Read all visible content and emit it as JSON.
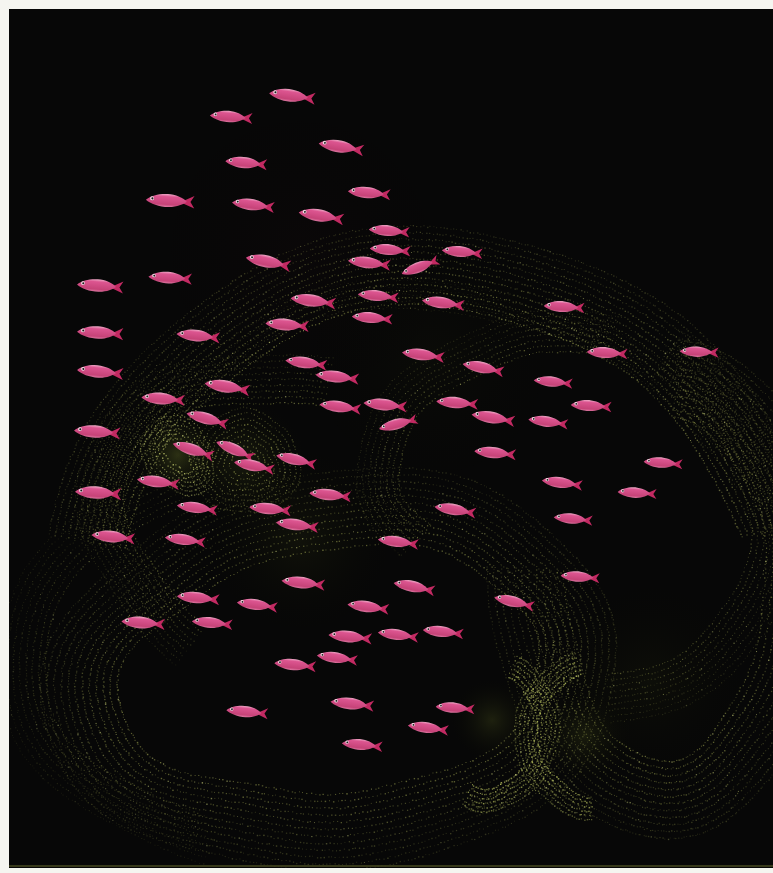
{
  "scene": {
    "description": "school of pink fish swimming left over pointillist olive-green coral scroll contours on a black field, white print border",
    "width": 773,
    "height": 873,
    "background_color": "#070707",
    "frame_color": "#f5f5f0",
    "bottom_edge_line_color": "#43461f",
    "frame_padding": {
      "top": 9,
      "left": 9,
      "right": 0,
      "bottom": 5
    },
    "seed": 7
  },
  "palette": {
    "dot_base": "#8f944a",
    "dot_bright": "#c2ca6c",
    "dot_dim": "#5d6030",
    "sparkle": "#d3da7f"
  },
  "fish_style": {
    "length": 46,
    "height": 13,
    "body_color": "#dc5590",
    "body_shade": "#c64378",
    "belly_color": "#e690b4",
    "dorsal_highlight": "#f2bcd3",
    "tail_color": "#c22a62",
    "eye_ring": "#ecdfe3",
    "pupil": "#201a1d"
  },
  "fish": [
    [
      292,
      96,
      8,
      1.0
    ],
    [
      231,
      117,
      5,
      0.92
    ],
    [
      341,
      147,
      10,
      0.98
    ],
    [
      246,
      163,
      6,
      0.9
    ],
    [
      170,
      201,
      4,
      1.05
    ],
    [
      253,
      205,
      8,
      0.92
    ],
    [
      369,
      193,
      6,
      0.92
    ],
    [
      321,
      216,
      10,
      0.98
    ],
    [
      389,
      231,
      5,
      0.88
    ],
    [
      268,
      262,
      12,
      0.98
    ],
    [
      369,
      263,
      7,
      0.92
    ],
    [
      100,
      286,
      5,
      1.0
    ],
    [
      170,
      278,
      4,
      0.94
    ],
    [
      313,
      301,
      8,
      0.98
    ],
    [
      390,
      250,
      5,
      0.88
    ],
    [
      420,
      267,
      -20,
      0.85
    ],
    [
      462,
      252,
      6,
      0.88
    ],
    [
      287,
      325,
      5,
      0.94
    ],
    [
      100,
      333,
      4,
      1.0
    ],
    [
      198,
      336,
      6,
      0.94
    ],
    [
      443,
      303,
      8,
      0.92
    ],
    [
      564,
      307,
      4,
      0.88
    ],
    [
      100,
      372,
      6,
      1.0
    ],
    [
      227,
      387,
      10,
      0.98
    ],
    [
      337,
      377,
      7,
      0.94
    ],
    [
      372,
      318,
      5,
      0.88
    ],
    [
      607,
      353,
      4,
      0.88
    ],
    [
      699,
      352,
      3,
      0.84
    ],
    [
      423,
      355,
      8,
      0.92
    ],
    [
      483,
      368,
      12,
      0.9
    ],
    [
      163,
      399,
      5,
      0.94
    ],
    [
      207,
      419,
      16,
      0.92
    ],
    [
      97,
      432,
      5,
      1.0
    ],
    [
      193,
      450,
      18,
      0.92
    ],
    [
      235,
      450,
      24,
      0.88
    ],
    [
      254,
      466,
      12,
      0.88
    ],
    [
      158,
      482,
      8,
      0.92
    ],
    [
      98,
      493,
      4,
      1.0
    ],
    [
      270,
      509,
      6,
      0.9
    ],
    [
      197,
      508,
      8,
      0.88
    ],
    [
      296,
      460,
      14,
      0.88
    ],
    [
      113,
      537,
      6,
      0.94
    ],
    [
      185,
      540,
      8,
      0.88
    ],
    [
      385,
      405,
      6,
      0.94
    ],
    [
      398,
      424,
      -14,
      0.85
    ],
    [
      457,
      403,
      5,
      0.9
    ],
    [
      493,
      418,
      10,
      0.94
    ],
    [
      591,
      406,
      4,
      0.88
    ],
    [
      548,
      422,
      8,
      0.86
    ],
    [
      495,
      453,
      6,
      0.9
    ],
    [
      553,
      382,
      6,
      0.84
    ],
    [
      663,
      463,
      5,
      0.84
    ],
    [
      562,
      483,
      8,
      0.88
    ],
    [
      637,
      493,
      4,
      0.84
    ],
    [
      455,
      510,
      10,
      0.9
    ],
    [
      573,
      519,
      6,
      0.84
    ],
    [
      297,
      525,
      8,
      0.92
    ],
    [
      330,
      495,
      6,
      0.9
    ],
    [
      143,
      623,
      5,
      0.94
    ],
    [
      198,
      598,
      6,
      0.92
    ],
    [
      257,
      605,
      8,
      0.88
    ],
    [
      212,
      623,
      6,
      0.88
    ],
    [
      303,
      583,
      7,
      0.94
    ],
    [
      368,
      607,
      8,
      0.9
    ],
    [
      414,
      587,
      12,
      0.9
    ],
    [
      350,
      637,
      6,
      0.94
    ],
    [
      398,
      635,
      8,
      0.88
    ],
    [
      443,
      632,
      7,
      0.88
    ],
    [
      514,
      602,
      14,
      0.88
    ],
    [
      580,
      577,
      5,
      0.84
    ],
    [
      398,
      542,
      8,
      0.88
    ],
    [
      295,
      665,
      6,
      0.9
    ],
    [
      337,
      658,
      8,
      0.88
    ],
    [
      247,
      712,
      6,
      0.9
    ],
    [
      352,
      704,
      7,
      0.94
    ],
    [
      428,
      728,
      8,
      0.88
    ],
    [
      362,
      745,
      6,
      0.88
    ],
    [
      455,
      708,
      5,
      0.84
    ],
    [
      306,
      363,
      8,
      0.9
    ],
    [
      378,
      296,
      6,
      0.88
    ],
    [
      340,
      407,
      8,
      0.9
    ]
  ],
  "contours": [
    {
      "name": "top-band",
      "cx": 430,
      "cy": 600,
      "rx": 318,
      "ry": 290,
      "rot": -4,
      "rings": 13,
      "gap": 6.5,
      "from": 195,
      "to": 352,
      "color": "#8f944a",
      "alpha": 0.75,
      "dot": 1.2,
      "spacing": 3.2,
      "wobble": 6,
      "phase": 0.5,
      "fade": 0.55
    },
    {
      "name": "top-outer-faint",
      "cx": 430,
      "cy": 640,
      "rx": 350,
      "ry": 330,
      "rot": -3,
      "rings": 5,
      "gap": 7,
      "from": 205,
      "to": 335,
      "color": "#5d6030",
      "alpha": 0.5,
      "dot": 1.0,
      "spacing": 3.8,
      "wobble": 7,
      "phase": 1.1,
      "fade": 0.7
    },
    {
      "name": "upper-fold",
      "cx": 520,
      "cy": 445,
      "rx": 130,
      "ry": 85,
      "rot": -28,
      "rings": 8,
      "gap": 6,
      "from": 160,
      "to": 330,
      "color": "#7d8140",
      "alpha": 0.7,
      "dot": 1.1,
      "spacing": 3.2,
      "wobble": 4,
      "phase": 2.1,
      "fade": 0.6
    },
    {
      "name": "left-arc",
      "cx": 300,
      "cy": 530,
      "rx": 178,
      "ry": 128,
      "rot": 18,
      "rings": 9,
      "gap": 6,
      "from": 110,
      "to": 265,
      "color": "#80853f",
      "alpha": 0.7,
      "dot": 1.1,
      "spacing": 3.2,
      "wobble": 5,
      "phase": 4.0,
      "fade": 0.6
    },
    {
      "name": "knot-spiral",
      "cx": 245,
      "cy": 462,
      "rx": 16,
      "ry": 13,
      "rot": 20,
      "rings": 8,
      "gap": 5.5,
      "from": 0,
      "to": 360,
      "color": "#a8ae55",
      "alpha": 0.85,
      "dot": 1.1,
      "spacing": 3.0,
      "wobble": 2,
      "phase": 1.2,
      "fade": 0.5
    },
    {
      "name": "bright-blob",
      "cx": 178,
      "cy": 455,
      "rx": 10,
      "ry": 20,
      "rot": -35,
      "rings": 6,
      "gap": 4.5,
      "from": 0,
      "to": 360,
      "color": "#c2ca6c",
      "alpha": 0.9,
      "dot": 1.2,
      "spacing": 2.6,
      "wobble": 2,
      "phase": 3.3,
      "fade": 0.45
    },
    {
      "name": "bowl",
      "cx": 332,
      "cy": 672,
      "rx": 212,
      "ry": 122,
      "rot": -7,
      "rings": 12,
      "gap": 7,
      "from": 0,
      "to": 360,
      "color": "#8f944a",
      "alpha": 0.7,
      "dot": 1.2,
      "spacing": 3.2,
      "wobble": 6,
      "phase": 5.2,
      "fade": 0.6
    },
    {
      "name": "lower-left-sweep",
      "cx": 330,
      "cy": 640,
      "rx": 285,
      "ry": 185,
      "rot": -10,
      "rings": 8,
      "gap": 6.5,
      "from": 120,
      "to": 245,
      "color": "#6f7336",
      "alpha": 0.55,
      "dot": 1.1,
      "spacing": 3.6,
      "wobble": 6,
      "phase": 3.9,
      "fade": 0.65
    },
    {
      "name": "right-descender",
      "cx": 598,
      "cy": 520,
      "rx": 148,
      "ry": 162,
      "rot": 8,
      "rings": 9,
      "gap": 6,
      "from": 285,
      "to": 438,
      "color": "#7d8140",
      "alpha": 0.65,
      "dot": 1.1,
      "spacing": 3.4,
      "wobble": 5,
      "phase": 0.9,
      "fade": 0.6
    },
    {
      "name": "right-valley",
      "cx": 664,
      "cy": 585,
      "rx": 100,
      "ry": 172,
      "rot": 0,
      "rings": 12,
      "gap": 7,
      "from": 275,
      "to": 545,
      "color": "#868b44",
      "alpha": 0.7,
      "dot": 1.2,
      "spacing": 3.2,
      "wobble": 4,
      "phase": 2.7,
      "fade": 0.55
    },
    {
      "name": "hook-left",
      "cx": 492,
      "cy": 730,
      "rx": 42,
      "ry": 58,
      "rot": 6,
      "rings": 6,
      "gap": 4.5,
      "from": 285,
      "to": 470,
      "color": "#b9c25f",
      "alpha": 0.9,
      "dot": 1.3,
      "spacing": 2.6,
      "wobble": 2,
      "phase": 1.8,
      "fade": 0.4
    },
    {
      "name": "hook-right",
      "cx": 590,
      "cy": 735,
      "rx": 52,
      "ry": 62,
      "rot": -5,
      "rings": 6,
      "gap": 4.5,
      "from": 95,
      "to": 265,
      "color": "#b9c25f",
      "alpha": 0.85,
      "dot": 1.3,
      "spacing": 2.6,
      "wobble": 2,
      "phase": 4.4,
      "fade": 0.4
    }
  ],
  "glows": [
    {
      "x": 178,
      "y": 455,
      "r": 48,
      "color": "#4c541f",
      "alpha": 0.55
    },
    {
      "x": 245,
      "y": 462,
      "r": 70,
      "color": "#343a16",
      "alpha": 0.4
    },
    {
      "x": 300,
      "y": 540,
      "r": 110,
      "color": "#23260f",
      "alpha": 0.35
    },
    {
      "x": 492,
      "y": 720,
      "r": 46,
      "color": "#3a4018",
      "alpha": 0.45
    },
    {
      "x": 585,
      "y": 735,
      "r": 52,
      "color": "#3a4018",
      "alpha": 0.4
    },
    {
      "x": 650,
      "y": 680,
      "r": 120,
      "color": "#1c1f0c",
      "alpha": 0.3
    },
    {
      "x": 430,
      "y": 360,
      "r": 160,
      "color": "#15170a",
      "alpha": 0.25
    },
    {
      "x": 300,
      "y": 250,
      "r": 200,
      "color": "#170a0d",
      "alpha": 0.2
    }
  ]
}
